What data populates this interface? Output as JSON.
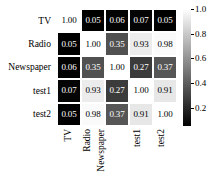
{
  "chart_data": {
    "type": "heatmap",
    "title": "",
    "xlabel": "",
    "ylabel": "",
    "categories": [
      "TV",
      "Radio",
      "Newspaper",
      "test1",
      "test2"
    ],
    "row_labels": [
      "TV",
      "Radio",
      "Newspaper",
      "test1",
      "test2"
    ],
    "col_labels": [
      "TV",
      "Radio",
      "Newspaper",
      "test1",
      "test2"
    ],
    "colormap": "grayscale",
    "grid": false,
    "legend_position": "right",
    "colorbar": {
      "min": 0.05,
      "max": 1.0,
      "ticks": [
        "1.0",
        "0.8",
        "0.6",
        "0.4",
        "0.2"
      ],
      "tick_values": [
        1.0,
        0.8,
        0.6,
        0.4,
        0.2
      ],
      "low_color": "#000000",
      "high_color": "#ffffff"
    },
    "values": [
      [
        1.0,
        0.05,
        0.06,
        0.07,
        0.05
      ],
      [
        0.05,
        1.0,
        0.35,
        0.93,
        0.98
      ],
      [
        0.06,
        0.35,
        1.0,
        0.27,
        0.37
      ],
      [
        0.07,
        0.93,
        0.27,
        1.0,
        0.91
      ],
      [
        0.05,
        0.98,
        0.37,
        0.91,
        1.0
      ]
    ],
    "cell_labels": [
      [
        "1.00",
        "0.05",
        "0.06",
        "0.07",
        "0.05"
      ],
      [
        "0.05",
        "1.00",
        "0.35",
        "0.93",
        "0.98"
      ],
      [
        "0.06",
        "0.35",
        "1.00",
        "0.27",
        "0.37"
      ],
      [
        "0.07",
        "0.93",
        "0.27",
        "1.00",
        "0.91"
      ],
      [
        "0.05",
        "0.98",
        "0.37",
        "0.91",
        "1.00"
      ]
    ]
  }
}
